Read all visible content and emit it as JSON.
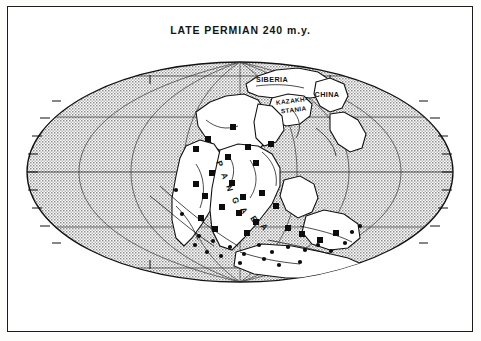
{
  "figure": {
    "title": "LATE PERMIAN 240 m.y.",
    "background_color": "#ffffff",
    "frame_color": "#1c1c1c",
    "ink_color": "#111111",
    "ocean_fill": "stipple-halftone-gray",
    "land_fill": "#ffffff",
    "projection": "mollweide-oval"
  },
  "map": {
    "graticule": {
      "meridian_spacing_deg": 30,
      "parallel_spacing_deg": 30,
      "tick_spacing_deg": 10,
      "visible": true
    },
    "labels": [
      {
        "id": "siberia",
        "text": "SIBERIA",
        "x": 272,
        "y": 80,
        "rotate": 0,
        "size": 7.0
      },
      {
        "id": "kazakhstania",
        "text": "KAZAKH-",
        "x": 292,
        "y": 101,
        "rotate": -8,
        "size": 6.2
      },
      {
        "id": "kazakhstania2",
        "text": "STANIA",
        "x": 293,
        "y": 110,
        "rotate": -8,
        "size": 6.2
      },
      {
        "id": "china",
        "text": "CHINA",
        "x": 326,
        "y": 95,
        "rotate": 0,
        "size": 7.0
      },
      {
        "id": "pangaea",
        "text": "PANGAEA",
        "x": 0,
        "y": 0,
        "rotate": 0,
        "size": 8.0
      }
    ],
    "pangaea_letters": [
      "P",
      "A",
      "N",
      "G",
      "A",
      "E",
      "A"
    ],
    "continents": [
      "laurentia-north-america",
      "siberia",
      "kazakhstania",
      "china-blocks",
      "baltica-europe",
      "gondwana-south-america",
      "gondwana-africa",
      "gondwana-india",
      "gondwana-australia",
      "gondwana-antarctica"
    ],
    "markers": {
      "symbol": "filled-square",
      "size_px": 6,
      "count": 24,
      "points": [
        [
          233,
          127
        ],
        [
          208,
          139
        ],
        [
          196,
          149
        ],
        [
          248,
          147
        ],
        [
          271,
          144
        ],
        [
          228,
          157
        ],
        [
          256,
          163
        ],
        [
          212,
          173
        ],
        [
          196,
          184
        ],
        [
          232,
          183
        ],
        [
          205,
          196
        ],
        [
          243,
          197
        ],
        [
          262,
          193
        ],
        [
          222,
          207
        ],
        [
          239,
          213
        ],
        [
          276,
          206
        ],
        [
          201,
          218
        ],
        [
          256,
          222
        ],
        [
          215,
          229
        ],
        [
          247,
          233
        ],
        [
          288,
          228
        ],
        [
          302,
          234
        ],
        [
          320,
          240
        ],
        [
          336,
          233
        ]
      ]
    },
    "dot_markers": {
      "symbol": "filled-circle",
      "size_px": 3,
      "points": [
        [
          213,
          241
        ],
        [
          230,
          247
        ],
        [
          244,
          254
        ],
        [
          259,
          245
        ],
        [
          272,
          252
        ],
        [
          288,
          247
        ],
        [
          305,
          250
        ],
        [
          318,
          245
        ],
        [
          331,
          251
        ],
        [
          345,
          243
        ],
        [
          264,
          259
        ],
        [
          240,
          263
        ],
        [
          199,
          236
        ],
        [
          182,
          214
        ],
        [
          176,
          190
        ],
        [
          300,
          262
        ],
        [
          279,
          265
        ],
        [
          221,
          256
        ],
        [
          352,
          232
        ],
        [
          360,
          226
        ],
        [
          207,
          252
        ],
        [
          195,
          245
        ]
      ]
    }
  }
}
